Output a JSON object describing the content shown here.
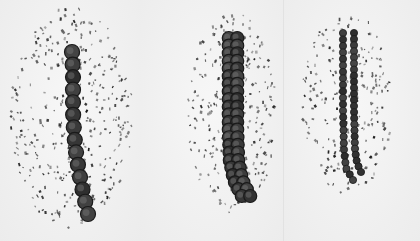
{
  "figure": {
    "background": "#f4f4f4",
    "filing_color": "#1e1e1e",
    "bead_color": "#3a3a3a",
    "panels": [
      {
        "id": "panel-1",
        "x": 0,
        "width": 140,
        "cloud": {
          "cx": 72,
          "cy": 118,
          "rx": 62,
          "ry": 112,
          "count": 360
        },
        "chains": [
          {
            "beads": 14,
            "radius": 7.5,
            "points": [
              [
                72,
                52
              ],
              [
                73,
                72
              ],
              [
                73,
                92
              ],
              [
                73,
                112
              ],
              [
                74,
                132
              ],
              [
                76,
                152
              ],
              [
                79,
                172
              ],
              [
                83,
                192
              ],
              [
                88,
                214
              ]
            ]
          }
        ]
      },
      {
        "id": "panel-2",
        "x": 140,
        "width": 143,
        "cloud": {
          "cx": 233,
          "cy": 112,
          "rx": 46,
          "ry": 100,
          "count": 260
        },
        "chains": [
          {
            "beads": 22,
            "radius": 6.5,
            "points": [
              [
                233,
                38
              ],
              [
                233,
                70
              ],
              [
                233,
                100
              ],
              [
                233,
                130
              ],
              [
                234,
                160
              ],
              [
                238,
                180
              ],
              [
                246,
                196
              ]
            ],
            "width": 2
          }
        ]
      },
      {
        "id": "panel-3",
        "x": 283,
        "width": 137,
        "cloud": {
          "cx": 348,
          "cy": 102,
          "rx": 46,
          "ry": 92,
          "count": 220
        },
        "chains": [
          {
            "beads": 24,
            "radius": 3.6,
            "points": [
              [
                343,
                33
              ],
              [
                343,
                70
              ],
              [
                343,
                110
              ],
              [
                344,
                150
              ],
              [
                346,
                168
              ],
              [
                353,
                180
              ]
            ]
          },
          {
            "beads": 24,
            "radius": 3.6,
            "points": [
              [
                354,
                33
              ],
              [
                354,
                70
              ],
              [
                354,
                110
              ],
              [
                355,
                150
              ],
              [
                357,
                163
              ],
              [
                361,
                172
              ]
            ]
          }
        ]
      }
    ]
  }
}
